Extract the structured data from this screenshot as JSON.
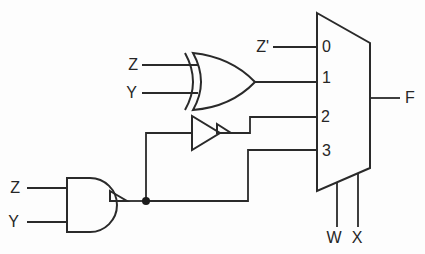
{
  "circuit": {
    "kind": "logic-circuit-diagram",
    "labels": {
      "mux_in0_signal": "Z'",
      "xor_in_top": "Z",
      "xor_in_bottom": "Y",
      "nand_in_top": "Z",
      "nand_in_bottom": "Y",
      "port0": "0",
      "port1": "1",
      "port2": "2",
      "port3": "3",
      "output": "F",
      "select_left": "W",
      "select_right": "X"
    },
    "components": [
      {
        "name": "signal-zprime",
        "label": "Z'",
        "connects_to": "mux-port-0"
      },
      {
        "name": "xor-gate",
        "inputs": [
          "Z",
          "Y"
        ],
        "connects_to": "mux-port-1"
      },
      {
        "name": "buffer-gate",
        "input_from": "nand-output-node",
        "connects_to": "mux-port-2"
      },
      {
        "name": "nand-gate",
        "inputs": [
          "Z",
          "Y"
        ],
        "connects_to": [
          "buffer-gate",
          "mux-port-3"
        ]
      },
      {
        "name": "mux-4to1",
        "ports": [
          "0",
          "1",
          "2",
          "3"
        ],
        "selects": [
          "W",
          "X"
        ],
        "output": "F"
      }
    ],
    "colors": {
      "line": "#2a2a2a",
      "background": "#fdfdfd"
    }
  }
}
